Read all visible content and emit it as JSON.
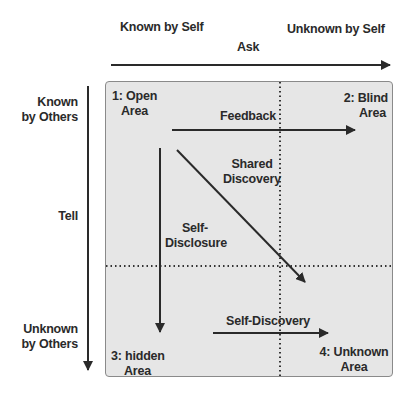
{
  "header": {
    "known_by_self": "Known by Self",
    "unknown_by_self": "Unknown by Self",
    "ask": "Ask"
  },
  "side": {
    "known_by_others": [
      "Known",
      "by Others"
    ],
    "tell": "Tell",
    "unknown_by_others": [
      "Unknown",
      "by Others"
    ]
  },
  "quadrants": {
    "open": [
      "1: Open",
      "Area"
    ],
    "blind": [
      "2: Blind",
      "Area"
    ],
    "hidden": [
      "3: hidden",
      "Area"
    ],
    "unknown": [
      "4: Unknown",
      "Area"
    ]
  },
  "arrows": {
    "feedback": "Feedback",
    "shared_discovery": [
      "Shared",
      "Discovery"
    ],
    "self_disclosure": [
      "Self-",
      "Disclosure"
    ],
    "self_discovery": "Self-Discovery"
  },
  "colors": {
    "box_fill": "#e6e6e6",
    "box_border": "#8a8a8a",
    "line": "#2a2a2a"
  }
}
